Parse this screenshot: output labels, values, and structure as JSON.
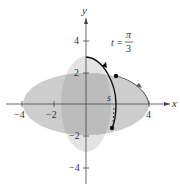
{
  "figure": {
    "type": "parametric-curve-diagram",
    "axes": {
      "x_label": "x",
      "y_label": "y",
      "x_ticks": [
        {
          "value": -4,
          "label": "−4"
        },
        {
          "value": -2,
          "label": "−2"
        },
        {
          "value": 4,
          "label": "4"
        }
      ],
      "y_ticks": [
        {
          "value": 4,
          "label": "4"
        },
        {
          "value": 2,
          "label": "2"
        },
        {
          "value": -2,
          "label": "−2"
        },
        {
          "value": -4,
          "label": "−4"
        }
      ]
    },
    "annotation": {
      "lhs": "t =",
      "numerator": "π",
      "denominator": "3"
    },
    "arc_label": "s",
    "regions": [
      {
        "name": "horizontal-ellipse",
        "a": 4,
        "b": 2,
        "color": "#c8c8c8"
      },
      {
        "name": "vertical-ellipse",
        "a": 1.6,
        "b": 3,
        "color": "#e2e2e2"
      }
    ],
    "colors": {
      "axis": "#444444",
      "curve": "#111111",
      "overlap": "#b5b5b5"
    }
  }
}
